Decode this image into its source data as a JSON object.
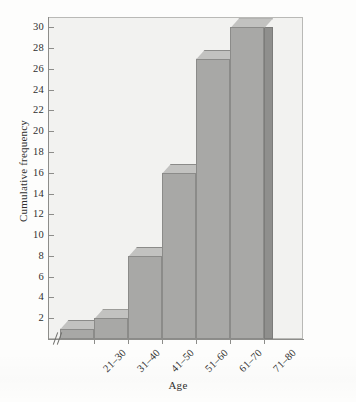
{
  "chart_data": {
    "type": "bar",
    "title": "",
    "subtitle": "",
    "xlabel": "Age",
    "ylabel": "Cumulative frequency",
    "categories": [
      "21–30",
      "31–40",
      "41–50",
      "51–60",
      "61–70",
      "71–80"
    ],
    "values": [
      1,
      2,
      8,
      16,
      27,
      30
    ],
    "ylim": [
      0,
      31
    ],
    "ytick_labels": [
      "2",
      "4",
      "6",
      "8",
      "10",
      "12",
      "14",
      "16",
      "18",
      "20",
      "22",
      "24",
      "26",
      "28",
      "30"
    ],
    "ytick_values": [
      2,
      4,
      6,
      8,
      10,
      12,
      14,
      16,
      18,
      20,
      22,
      24,
      26,
      28,
      30
    ],
    "grid": false,
    "legend": null,
    "legend_position": "none",
    "annotations": [
      "axis break on x-axis near origin"
    ],
    "style": {
      "bar_front_color": "#a8a8a6",
      "bar_top_color": "#c2c2c0",
      "bar_side_color": "#8f8f8d",
      "bar_edge_color": "#8b8b89",
      "plot_background": "#f2f2f0",
      "page_background": "#fdfdfc",
      "axis_color": "#8d8d8a",
      "text_color": "#2f2f2f",
      "effect": "3d-bars",
      "bar_gap": 0
    }
  }
}
